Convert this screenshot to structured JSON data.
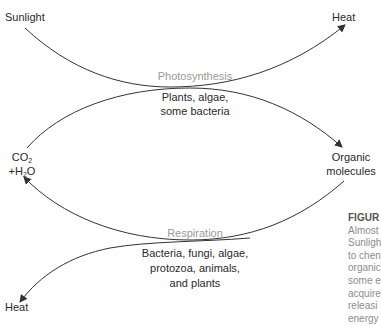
{
  "diagram": {
    "nodes": {
      "sunlight": "Sunlight",
      "heat_top": "Heat",
      "heat_bottom": "Heat",
      "co2_line1": "CO",
      "co2_sub": "2",
      "h2o_prefix": "+H",
      "h2o_sub": "2",
      "h2o_suffix": "O",
      "organic_line1": "Organic",
      "organic_line2": "molecules"
    },
    "processes": {
      "photosynthesis": {
        "label": "Photosynthesis",
        "organisms": [
          "Plants, algae,",
          "some bacteria"
        ]
      },
      "respiration": {
        "label": "Respiration",
        "organisms": [
          "Bacteria, fungi, algae,",
          "protozoa, animals,",
          "and plants"
        ]
      }
    },
    "caption": {
      "heading": "FIGUR",
      "lines": [
        "Almost",
        "Sunligh",
        "to chen",
        "organic",
        "some e",
        "acquire",
        "releasi",
        "energy"
      ]
    }
  }
}
